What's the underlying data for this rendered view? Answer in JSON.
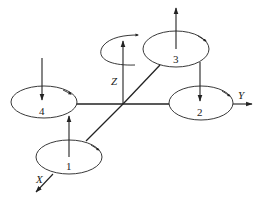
{
  "diagram": {
    "type": "quadrotor-coordinate-frame",
    "axes": [
      {
        "name": "X",
        "label": "X"
      },
      {
        "name": "Y",
        "label": "Y"
      },
      {
        "name": "Z",
        "label": "Z"
      }
    ],
    "rotors": [
      {
        "id": 1,
        "label": "1",
        "thrust": "up"
      },
      {
        "id": 2,
        "label": "2",
        "thrust": "down"
      },
      {
        "id": 3,
        "label": "3",
        "thrust": "up"
      },
      {
        "id": 4,
        "label": "4",
        "thrust": "down"
      }
    ],
    "colors": {
      "line": "#222222",
      "background": "#ffffff"
    }
  }
}
